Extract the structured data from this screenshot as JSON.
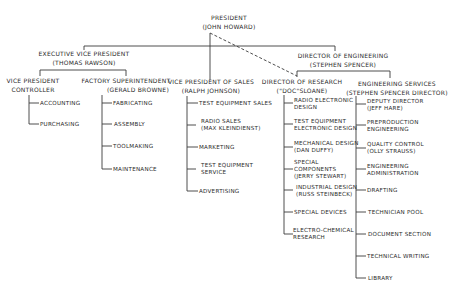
{
  "president": {
    "title": "PRESIDENT",
    "name": "(JOHN HOWARD)"
  },
  "executive_vp": {
    "title": "EXECUTIVE VICE PRESIDENT",
    "name": "(THOMAS RAWSON)"
  },
  "director_engineering": {
    "title": "DIRECTOR OF ENGINEERING",
    "name": "(STEPHEN SPENCER)"
  },
  "vp_controller": {
    "title": "VICE PRESIDENT",
    "subtitle": "CONTROLLER",
    "items": [
      "ACCOUNTING",
      "PURCHASING"
    ]
  },
  "factory_superintendent": {
    "title": "FACTORY SUPERINTENDENT",
    "name": "(GERALD BROWNE)",
    "items": [
      "FABRICATING",
      "ASSEMBLY",
      "TOOLMAKING",
      "MAINTENANCE"
    ]
  },
  "vp_sales": {
    "title": "VICE PRESIDENT OF SALES",
    "name": "(RALPH JOHNSON)",
    "items": [
      {
        "line1": "TEST EQUIPMENT SALES"
      },
      {
        "line1": "RADIO SALES",
        "line2": "(MAX KLEINDIENST)"
      },
      {
        "line1": "MARKETING"
      },
      {
        "line1": "TEST EQUIPMENT",
        "line2": "SERVICE"
      },
      {
        "line1": "ADVERTISING"
      }
    ]
  },
  "director_research": {
    "title": "DIRECTOR OF RESEARCH",
    "name": "(\"DOC\"SLOANE)",
    "items": [
      {
        "line1": "RADIO ELECTRONIC",
        "line2": "DESIGN"
      },
      {
        "line1": "TEST EQUIPMENT",
        "line2": "ELECTRONIC DESIGN"
      },
      {
        "line1": "MECHANICAL DESIGN",
        "line2": "(DAN DUFFY)"
      },
      {
        "line1": "SPECIAL",
        "line2": "COMPONENTS",
        "line3": "(JERRY STEWART)"
      },
      {
        "line1": "INDUSTRIAL DESIGN",
        "line2": "(RUSS STEINBECK)"
      },
      {
        "line1": "SPECIAL DEVICES"
      },
      {
        "line1": "ELECTRO-CHEMICAL",
        "line2": "RESEARCH"
      }
    ]
  },
  "engineering_services": {
    "title": "ENGINEERING SERVICES",
    "name": "(STEPHEN SPENCER DIRECTOR)",
    "items": [
      {
        "line1": "DEPUTY DIRECTOR",
        "line2": "(JEFF HARE)"
      },
      {
        "line1": "PREPRODUCTION",
        "line2": "ENGINEERING"
      },
      {
        "line1": "QUALITY CONTROL",
        "line2": "(OLLY STRAUSS)"
      },
      {
        "line1": "ENGINEERING",
        "line2": "ADMINISTRATION"
      },
      {
        "line1": "DRAFTING"
      },
      {
        "line1": "TECHNICIAN POOL"
      },
      {
        "line1": "DOCUMENT SECTION"
      },
      {
        "line1": "TECHNICAL WRITING"
      },
      {
        "line1": "LIBRARY"
      }
    ]
  }
}
